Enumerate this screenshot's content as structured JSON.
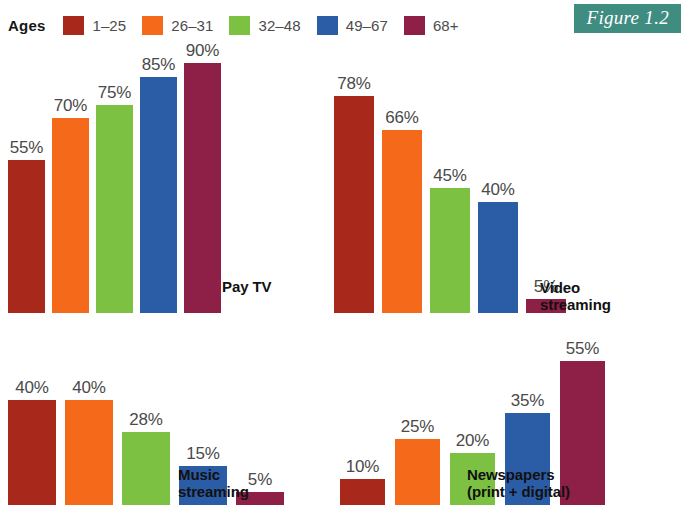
{
  "legend": {
    "title": "Ages",
    "items": [
      {
        "label": "1–25",
        "color": "#a8291c"
      },
      {
        "label": "26–31",
        "color": "#f4691a"
      },
      {
        "label": "32–48",
        "color": "#7cc142"
      },
      {
        "label": "49–67",
        "color": "#2b5ca6"
      },
      {
        "label": "68+",
        "color": "#8e1f46"
      }
    ]
  },
  "figure_tag": {
    "label": "Figure 1.2",
    "background": "#3f8c80",
    "text_color": "#ffffff"
  },
  "chart_data": {
    "type": "bar",
    "title": "",
    "xlabel": "",
    "ylabel": "",
    "ylim": [
      0,
      100
    ],
    "grid": false,
    "legend_position": "top-left",
    "unit": "%",
    "categories": [
      "1–25",
      "26–31",
      "32–48",
      "49–67",
      "68+"
    ],
    "colors": [
      "#a8291c",
      "#f4691a",
      "#7cc142",
      "#2b5ca6",
      "#8e1f46"
    ],
    "panels": [
      {
        "name": "Pay TV",
        "label_lines": [
          "Pay TV"
        ],
        "values": [
          55,
          70,
          75,
          85,
          90
        ],
        "value_labels": [
          "55%",
          "70%",
          "75%",
          "85%",
          "90%"
        ]
      },
      {
        "name": "Video streaming",
        "label_lines": [
          "Video",
          "streaming"
        ],
        "values": [
          78,
          66,
          45,
          40,
          5
        ],
        "value_labels": [
          "78%",
          "66%",
          "45%",
          "40%",
          "5%"
        ]
      },
      {
        "name": "Music streaming",
        "label_lines": [
          "Music",
          "streaming"
        ],
        "values": [
          40,
          40,
          28,
          15,
          5
        ],
        "value_labels": [
          "40%",
          "40%",
          "28%",
          "15%",
          "5%"
        ]
      },
      {
        "name": "Newspapers (print + digital)",
        "label_lines": [
          "Newspapers",
          "(print + digital)"
        ],
        "values": [
          10,
          25,
          20,
          35,
          55
        ],
        "value_labels": [
          "10%",
          "25%",
          "20%",
          "35%",
          "55%"
        ]
      }
    ]
  }
}
